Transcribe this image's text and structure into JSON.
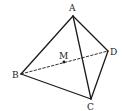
{
  "figure": {
    "type": "tetrahedron",
    "stroke_color": "#1a1a1a",
    "background": "#ffffff",
    "points": {
      "A": {
        "label": "A",
        "x": 73,
        "y": 16
      },
      "B": {
        "label": "B",
        "x": 21,
        "y": 74
      },
      "C": {
        "label": "C",
        "x": 91,
        "y": 99
      },
      "D": {
        "label": "D",
        "x": 108,
        "y": 51
      },
      "M": {
        "label": "M",
        "x": 64,
        "y": 62
      }
    },
    "solid_edges": [
      "AB",
      "AC",
      "AD",
      "BC",
      "CD"
    ],
    "dashed_edges": [
      "BD"
    ],
    "marked_points": [
      "M"
    ]
  }
}
